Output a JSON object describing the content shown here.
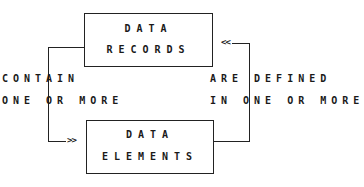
{
  "diagram": {
    "type": "entity-relationship",
    "nodes": [
      {
        "id": "records",
        "lines": [
          "DATA",
          "RECORDS"
        ]
      },
      {
        "id": "elements",
        "lines": [
          "DATA",
          "ELEMENTS"
        ]
      }
    ],
    "edges": [
      {
        "from": "records",
        "to": "elements",
        "label_lines": [
          "CONTAIN",
          "ONE OR MORE"
        ],
        "arrow": ">>"
      },
      {
        "from": "elements",
        "to": "records",
        "label_lines": [
          "ARE DEFINED",
          "IN ONE OR MORE"
        ],
        "arrow": "<<"
      }
    ],
    "colors": {
      "line": "#222222",
      "text": "#1a1a1a",
      "background": "#ffffff"
    }
  }
}
